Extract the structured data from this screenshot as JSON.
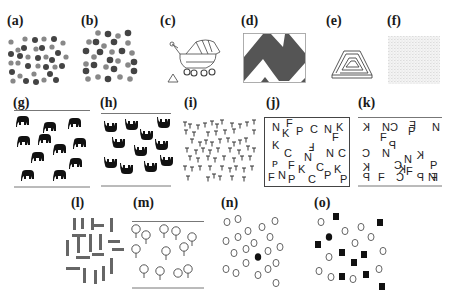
{
  "figure": {
    "panels": [
      {
        "id": "a",
        "label": "(a)",
        "description": "dots of two shades"
      },
      {
        "id": "b",
        "label": "(b)",
        "description": "dots of two shades, larger"
      },
      {
        "id": "c",
        "label": "(c)",
        "description": "baby stroller and small triangle"
      },
      {
        "id": "d",
        "label": "(d)",
        "description": "zigzag pattern in box"
      },
      {
        "id": "e",
        "label": "(e)",
        "description": "impossible triangle spiral"
      },
      {
        "id": "f",
        "label": "(f)",
        "description": "faint texture"
      },
      {
        "id": "g",
        "label": "(g)",
        "description": "upright elephants"
      },
      {
        "id": "h",
        "label": "(h)",
        "description": "upside-down elephants"
      },
      {
        "id": "i",
        "label": "(i)",
        "description": "field of T letters"
      },
      {
        "id": "j",
        "label": "(j)",
        "description": "letters in box"
      },
      {
        "id": "k",
        "label": "(k)",
        "description": "mirrored letters"
      },
      {
        "id": "l",
        "label": "(l)",
        "description": "vertical and horizontal bars"
      },
      {
        "id": "m",
        "label": "(m)",
        "description": "circles with stems"
      },
      {
        "id": "n",
        "label": "(n)",
        "description": "open circles with one filled circle"
      },
      {
        "id": "o",
        "label": "(o)",
        "description": "open circles, black squares, one filled circle"
      }
    ],
    "letters_j": [
      [
        "N",
        10,
        18
      ],
      [
        "F",
        28,
        12
      ],
      [
        "K",
        22,
        24
      ],
      [
        "P",
        44,
        26
      ],
      [
        "C",
        62,
        20
      ],
      [
        "N",
        82,
        20
      ],
      [
        "K",
        102,
        18
      ],
      [
        "F",
        94,
        30
      ],
      [
        "K",
        10,
        42
      ],
      [
        "C",
        26,
        54
      ],
      [
        "F",
        58,
        44
      ],
      [
        "N",
        54,
        58
      ],
      [
        "N",
        86,
        56
      ],
      [
        "C",
        106,
        56
      ],
      [
        "P",
        10,
        70
      ],
      [
        "F",
        34,
        74
      ],
      [
        "K",
        46,
        80
      ],
      [
        "C",
        70,
        78
      ],
      [
        "P",
        82,
        88
      ],
      [
        "K",
        96,
        82
      ],
      [
        "F",
        4,
        92
      ],
      [
        "N",
        18,
        92
      ],
      [
        "P",
        34,
        94
      ],
      [
        "C",
        62,
        98
      ],
      [
        "P",
        106,
        98
      ]
    ],
    "letters_k": [
      [
        "K",
        8,
        18
      ],
      [
        "N",
        30,
        20
      ],
      [
        "C",
        54,
        20
      ],
      [
        "F",
        74,
        14
      ],
      [
        "P",
        68,
        24
      ],
      [
        "N",
        108,
        20
      ],
      [
        "F",
        30,
        34
      ],
      [
        "K",
        104,
        38
      ],
      [
        "C",
        8,
        54
      ],
      [
        "N",
        28,
        56
      ],
      [
        "P",
        52,
        50
      ],
      [
        "N",
        74,
        60
      ],
      [
        "C",
        74,
        72
      ],
      [
        "K",
        10,
        78
      ],
      [
        "C",
        44,
        78
      ],
      [
        "F",
        72,
        84
      ],
      [
        "K",
        82,
        90
      ],
      [
        "P",
        104,
        82
      ],
      [
        "P",
        8,
        96
      ],
      [
        "F",
        28,
        96
      ],
      [
        "C",
        50,
        96
      ],
      [
        "P",
        80,
        98
      ],
      [
        "N",
        96,
        96
      ],
      [
        "F",
        112,
        98
      ]
    ]
  }
}
